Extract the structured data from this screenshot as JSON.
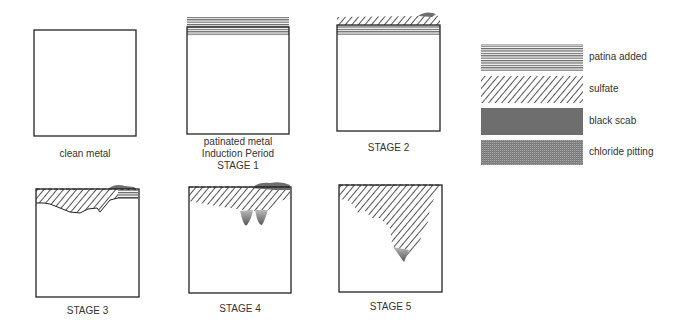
{
  "diagram": {
    "type": "corrosion-stages",
    "panels": [
      {
        "id": "clean",
        "caption": [
          "clean metal"
        ]
      },
      {
        "id": "stage1",
        "caption": [
          "patinated metal",
          "Induction Period",
          "STAGE 1"
        ]
      },
      {
        "id": "stage2",
        "caption": [
          "STAGE 2"
        ]
      },
      {
        "id": "stage3",
        "caption": [
          "STAGE 3"
        ]
      },
      {
        "id": "stage4",
        "caption": [
          "STAGE 4"
        ]
      },
      {
        "id": "stage5",
        "caption": [
          "STAGE 5"
        ]
      }
    ],
    "legend": [
      {
        "pattern": "horizontal-lines",
        "label": "patina added"
      },
      {
        "pattern": "diagonal-hatch",
        "label": "sulfate"
      },
      {
        "pattern": "solid-dark-gray",
        "label": "black scab"
      },
      {
        "pattern": "gradient-stipple",
        "label": "chloride pitting"
      }
    ],
    "colors": {
      "outline": "#222222",
      "scab": "#6e6e6e",
      "hatch": "#555555"
    }
  }
}
